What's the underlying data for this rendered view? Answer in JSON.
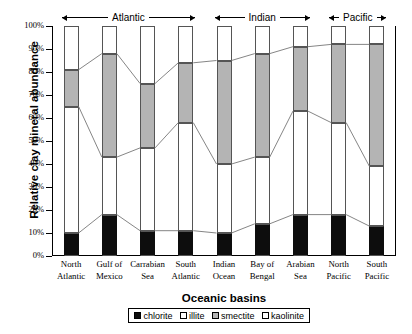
{
  "chart_data": {
    "type": "bar",
    "subtype": "stacked-100-percent",
    "title": "",
    "xlabel": "Oceanic basins",
    "ylabel": "Relative clay mineral abundance",
    "ylim": [
      0,
      100
    ],
    "yunit": "%",
    "ytick_labels": [
      "100%",
      "90%",
      "80%",
      "70%",
      "60%",
      "50%",
      "40%",
      "30%",
      "20%",
      "10%",
      "0%"
    ],
    "ytick_values": [
      100,
      90,
      80,
      70,
      60,
      50,
      40,
      30,
      20,
      10,
      0
    ],
    "grid": false,
    "legend_position": "bottom",
    "categories": [
      "North Atlantic",
      "Gulf of Mexico",
      "Carrabian Sea",
      "South Atlantic",
      "Indian Ocean",
      "Bay of Bengal",
      "Arabian Sea",
      "North Pacific",
      "South Pacific"
    ],
    "category_lines": [
      [
        "North",
        "Atlantic"
      ],
      [
        "Gulf of",
        "Mexico"
      ],
      [
        "Carrabian",
        "Sea"
      ],
      [
        "South",
        "Atlantic"
      ],
      [
        "Indian",
        "Ocean"
      ],
      [
        "Bay of",
        "Bengal"
      ],
      [
        "Arabian",
        "Sea"
      ],
      [
        "North",
        "Pacific"
      ],
      [
        "South",
        "Pacific"
      ]
    ],
    "series": [
      {
        "name": "chlorite",
        "color": "#0d0d0d",
        "values": [
          10,
          18,
          11,
          11,
          10,
          14,
          18,
          18,
          13
        ]
      },
      {
        "name": "illite",
        "color": "#ffffff",
        "values": [
          55,
          25,
          36,
          47,
          30,
          29,
          45,
          40,
          26
        ]
      },
      {
        "name": "smectite",
        "color": "#b4b4b4",
        "values": [
          16,
          45,
          28,
          26,
          45,
          45,
          28,
          34,
          53
        ]
      },
      {
        "name": "kaolinite",
        "color": "#ffffff",
        "values": [
          19,
          12,
          25,
          16,
          15,
          12,
          9,
          8,
          8
        ]
      }
    ],
    "cumulative_boundaries": [
      {
        "category": "North Atlantic",
        "chlorite_top": 10,
        "illite_top": 65,
        "smectite_top": 81,
        "kaolinite_top": 100
      },
      {
        "category": "Gulf of Mexico",
        "chlorite_top": 18,
        "illite_top": 43,
        "smectite_top": 88,
        "kaolinite_top": 100
      },
      {
        "category": "Carrabian Sea",
        "chlorite_top": 11,
        "illite_top": 47,
        "smectite_top": 75,
        "kaolinite_top": 100
      },
      {
        "category": "South Atlantic",
        "chlorite_top": 11,
        "illite_top": 58,
        "smectite_top": 84,
        "kaolinite_top": 100
      },
      {
        "category": "Indian Ocean",
        "chlorite_top": 10,
        "illite_top": 40,
        "smectite_top": 85,
        "kaolinite_top": 100
      },
      {
        "category": "Bay of Bengal",
        "chlorite_top": 14,
        "illite_top": 43,
        "smectite_top": 88,
        "kaolinite_top": 100
      },
      {
        "category": "Arabian Sea",
        "chlorite_top": 18,
        "illite_top": 63,
        "smectite_top": 91,
        "kaolinite_top": 100
      },
      {
        "category": "North Pacific",
        "chlorite_top": 18,
        "illite_top": 58,
        "smectite_top": 92,
        "kaolinite_top": 100
      },
      {
        "category": "South Pacific",
        "chlorite_top": 13,
        "illite_top": 39,
        "smectite_top": 92,
        "kaolinite_top": 100
      }
    ],
    "legend_entries": [
      "chlorite",
      "illite",
      "smectite",
      "kaolinite"
    ],
    "annotations": [
      {
        "label": "Atlantic",
        "span_start": 0,
        "span_end": 3
      },
      {
        "label": "Indian",
        "span_start": 4,
        "span_end": 6
      },
      {
        "label": "Pacific",
        "span_start": 7,
        "span_end": 8
      }
    ]
  },
  "legend": {
    "items": [
      {
        "name": "chlorite",
        "label": "chlorite"
      },
      {
        "name": "illite",
        "label": "illite"
      },
      {
        "name": "smectite",
        "label": "smectite"
      },
      {
        "name": "kaolinite",
        "label": "kaolinite"
      }
    ]
  }
}
